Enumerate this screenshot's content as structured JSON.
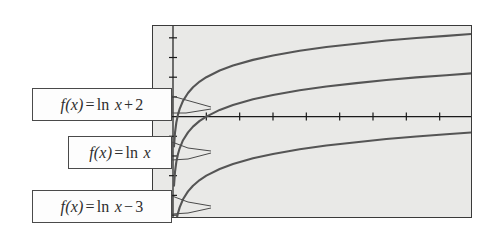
{
  "figure": {
    "background_color": "#ffffff",
    "plot_background_color": "#e9e9e7",
    "border_color": "#3a3a3a",
    "curve_color": "#555555",
    "axis_color": "#1a1a1a"
  },
  "chart_data": {
    "type": "line",
    "title": "",
    "xlabel": "",
    "ylabel": "",
    "xlim": [
      -0.6,
      9.0
    ],
    "ylim": [
      -5.2,
      4.6
    ],
    "grid": false,
    "legend_position": "callout-labels-left",
    "axis_ticks": {
      "x_tick_values": [
        1,
        2,
        3,
        4,
        5,
        6,
        7,
        8
      ],
      "y_tick_values": [
        -5,
        -4,
        -3,
        -2,
        -1,
        1,
        2,
        3,
        4
      ],
      "tick_labels_shown": false
    },
    "series": [
      {
        "name": "f(x) = ln x + 2",
        "label": "f(x) = ln x + 2",
        "expression": "ln(x) + 2",
        "offset": 2,
        "x": [
          0.03,
          0.06,
          0.1,
          0.15,
          0.2,
          0.3,
          0.45,
          0.6,
          0.8,
          1.0,
          1.4,
          1.8,
          2.4,
          3.0,
          3.8,
          4.6,
          5.5,
          6.4,
          7.3,
          8.2,
          9.0
        ],
        "y": [
          -1.51,
          -0.81,
          -0.3,
          0.1,
          0.39,
          0.8,
          1.2,
          1.49,
          1.78,
          2.0,
          2.34,
          2.59,
          2.88,
          3.1,
          3.34,
          3.53,
          3.7,
          3.86,
          3.99,
          4.1,
          4.2
        ]
      },
      {
        "name": "f(x) = ln x",
        "label": "f(x) = ln x",
        "expression": "ln(x)",
        "offset": 0,
        "x": [
          0.03,
          0.06,
          0.1,
          0.15,
          0.2,
          0.3,
          0.45,
          0.6,
          0.8,
          1.0,
          1.4,
          1.8,
          2.4,
          3.0,
          3.8,
          4.6,
          5.5,
          6.4,
          7.3,
          8.2,
          9.0
        ],
        "y": [
          -3.51,
          -2.81,
          -2.3,
          -1.9,
          -1.61,
          -1.2,
          -0.8,
          -0.51,
          -0.22,
          0.0,
          0.34,
          0.59,
          0.88,
          1.1,
          1.34,
          1.53,
          1.7,
          1.86,
          1.99,
          2.1,
          2.2
        ]
      },
      {
        "name": "f(x) = ln x - 3",
        "label": "f(x) = ln x − 3",
        "expression": "ln(x) - 3",
        "offset": -3,
        "x": [
          0.12,
          0.15,
          0.2,
          0.3,
          0.45,
          0.6,
          0.8,
          1.0,
          1.4,
          1.8,
          2.4,
          3.0,
          3.8,
          4.6,
          5.5,
          6.4,
          7.3,
          8.2,
          9.0
        ],
        "y": [
          -5.12,
          -4.9,
          -4.61,
          -4.2,
          -3.8,
          -3.51,
          -3.22,
          -3.0,
          -2.66,
          -2.41,
          -2.12,
          -1.9,
          -1.66,
          -1.47,
          -1.3,
          -1.14,
          -1.01,
          -0.9,
          -0.8
        ]
      }
    ]
  },
  "callouts": [
    {
      "id": "callout-0",
      "prefix": "f",
      "arg": "(x)",
      "equals": "=",
      "fn": "ln",
      "var": "x",
      "op": "+",
      "const": "2",
      "full_text": "f(x) = ln x + 2",
      "points_to": "f(x) = ln x + 2"
    },
    {
      "id": "callout-1",
      "prefix": "f",
      "arg": "(x)",
      "equals": "=",
      "fn": "ln",
      "var": "x",
      "op": "",
      "const": "",
      "full_text": "f(x) = ln x",
      "points_to": "f(x) = ln x"
    },
    {
      "id": "callout-2",
      "prefix": "f",
      "arg": "(x)",
      "equals": "=",
      "fn": "ln",
      "var": "x",
      "op": "−",
      "const": "3",
      "full_text": "f(x) = ln x − 3",
      "points_to": "f(x) = ln x - 3"
    }
  ]
}
